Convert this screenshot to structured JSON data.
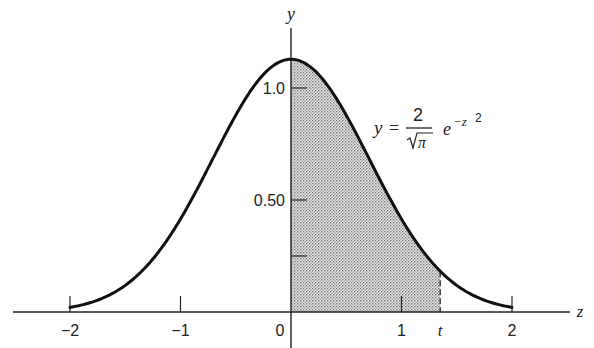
{
  "chart_data": {
    "type": "area",
    "title": "",
    "function_label": {
      "lhs": "y",
      "equals": "=",
      "numerator": "2",
      "denominator_radicand": "π",
      "exp_base": "e",
      "exponent": "−z",
      "exponent_power": "2",
      "expression": "y = 2/√π e^(−z²)"
    },
    "xlabel": "z",
    "ylabel": "y",
    "xlim": [
      -2.5,
      2.5
    ],
    "ylim": [
      0,
      1.2
    ],
    "x_ticks": [
      {
        "value": -2,
        "label": "−2"
      },
      {
        "value": -1,
        "label": "−1"
      },
      {
        "value": 0,
        "label": "0"
      },
      {
        "value": 1,
        "label": "1"
      },
      {
        "value": 2,
        "label": "2"
      }
    ],
    "x_special_tick": {
      "value": 1.35,
      "label": "t"
    },
    "y_ticks": [
      {
        "value": 0.25,
        "label": ""
      },
      {
        "value": 0.5,
        "label": "0.50"
      },
      {
        "value": 1.0,
        "label": "1.0"
      }
    ],
    "curve": {
      "domain": [
        -2,
        2
      ],
      "coefficient": 1.1284,
      "description": "y = (2/sqrt(pi)) * exp(-z^2)"
    },
    "shaded_region": {
      "from": 0,
      "to": 1.35,
      "pattern": "stipple"
    },
    "grid": false,
    "legend": "none"
  }
}
